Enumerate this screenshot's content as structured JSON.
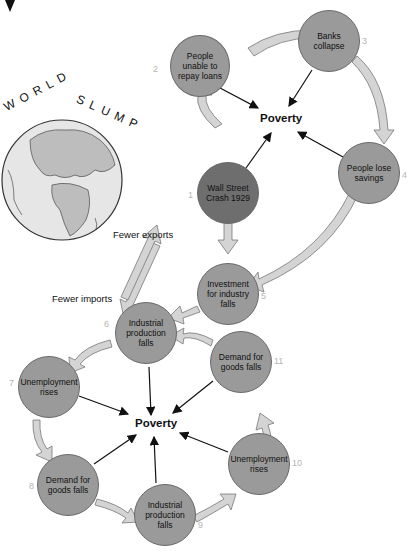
{
  "top_cycle": {
    "center_label": "Poverty",
    "nodes": [
      {
        "num": "1",
        "text": "Wall Street Crash 1929"
      },
      {
        "num": "2",
        "text": "People unable to repay loans"
      },
      {
        "num": "3",
        "text": "Banks collapse"
      },
      {
        "num": "4",
        "text": "People lose savings"
      }
    ]
  },
  "bottom_cycle": {
    "center_label": "Poverty",
    "nodes": [
      {
        "num": "5",
        "text": "Investment for industry falls"
      },
      {
        "num": "6",
        "text": "Industrial production falls"
      },
      {
        "num": "7",
        "text": "Unemployment rises"
      },
      {
        "num": "8",
        "text": "Demand for goods falls"
      },
      {
        "num": "9",
        "text": "Industrial production falls"
      },
      {
        "num": "10",
        "text": "Unemployment rises"
      },
      {
        "num": "11",
        "text": "Demand for goods falls"
      }
    ]
  },
  "globe": {
    "title_left": "WORLD",
    "title_right": "SLUMP",
    "fewer_exports": "Fewer exports",
    "fewer_imports": "Fewer imports"
  },
  "colors": {
    "node_fill": "#9a9a9a",
    "crash_fill": "#6e6e6e",
    "arrow_fill": "#d4d4d4",
    "number_color": "#b5b5b5"
  }
}
